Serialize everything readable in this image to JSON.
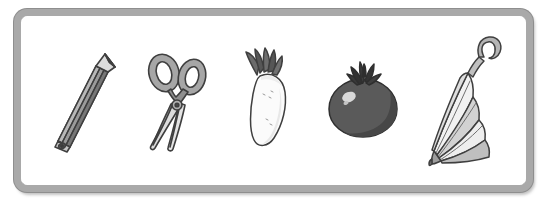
{
  "scene": {
    "title": "Picture card row of five objects",
    "background_color": "#ffffff",
    "frame": {
      "name": "rounded rectangle border",
      "border_color": "#a9a9a9",
      "outline_color": "#8e8e8e",
      "fill_color": "#ffffff",
      "style": "rounded",
      "x": 14,
      "y": 9,
      "width": 519,
      "height": 183,
      "border_width": 7,
      "corner_radius": 13
    },
    "item_count": 5,
    "palette": {
      "dark_gray": "#4a4a4a",
      "mid_gray": "#8c8c8c",
      "light_gray": "#c9c9c9",
      "pale_gray": "#e3e3e3",
      "near_white": "#f7f7f7",
      "outline": "#3f3f3f"
    }
  },
  "items": [
    {
      "name": "pencil",
      "label": "pencil",
      "icon": "pencil-icon",
      "order": 1,
      "orientation": "tilted, tip pointing upper-right",
      "colors": {
        "body": "#9a9a9a",
        "body_shade": "#6e6e6e",
        "wood": "#d8d8d8",
        "lead": "#3a3a3a",
        "outline": "#3f3f3f"
      }
    },
    {
      "name": "scissors",
      "label": "scissors",
      "icon": "scissors-icon",
      "order": 2,
      "orientation": "handles up, blades pointing down-left",
      "colors": {
        "handle": "#a6a6a6",
        "handle_inner": "#ffffff",
        "blade": "#dcdcdc",
        "blade_shade": "#bdbdbd",
        "outline": "#3f3f3f"
      }
    },
    {
      "name": "radish",
      "label": "white radish",
      "icon": "radish-icon",
      "order": 3,
      "orientation": "root down-right, leaves up-left",
      "colors": {
        "root": "#fbfbfb",
        "root_shade": "#e6e6e6",
        "leaves": "#6b6b6b",
        "leaves_shade": "#4f4f4f",
        "outline": "#3f3f3f"
      }
    },
    {
      "name": "tomato",
      "label": "tomato",
      "icon": "tomato-icon",
      "order": 4,
      "orientation": "upright with calyx on top",
      "colors": {
        "fruit": "#5a5a5a",
        "fruit_shade": "#474747",
        "highlight": "#d9d9d9",
        "calyx": "#3a3a3a",
        "outline": "#2f2f2f"
      }
    },
    {
      "name": "umbrella",
      "label": "closed umbrella",
      "icon": "umbrella-icon",
      "order": 5,
      "orientation": "closed, hook handle upper-right, tip lower-left",
      "colors": {
        "panel_light": "#f2f2f2",
        "panel_mid": "#d2d2d2",
        "panel_dark": "#a8a8a8",
        "handle": "#b5b5b5",
        "outline": "#3f3f3f"
      }
    }
  ]
}
